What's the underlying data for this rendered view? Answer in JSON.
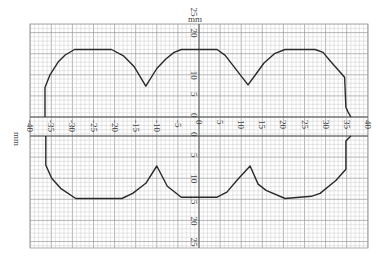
{
  "chart_data": {
    "type": "line",
    "title": "",
    "xlabel": "mm",
    "ylabel": "mm",
    "xlim": [
      -40,
      40
    ],
    "ylim_upper": [
      0,
      25
    ],
    "ylim_lower": [
      0,
      25
    ],
    "grid": true,
    "x_ticks": [
      -40,
      -35,
      -30,
      -25,
      -20,
      -15,
      -10,
      -5,
      0,
      5,
      10,
      15,
      20,
      25,
      30,
      35,
      40
    ],
    "y_ticks_upper": [
      0,
      5,
      10,
      20,
      25
    ],
    "y_ticks_lower": [
      0,
      5,
      10,
      15,
      20,
      25
    ],
    "series": [
      {
        "name": "upper profile",
        "x": [
          -36.5,
          -36.5,
          -35.3,
          -33.4,
          -31.7,
          -29.5,
          -20.7,
          -17.8,
          -15.4,
          -12.6,
          -10,
          -7.8,
          -5.9,
          -4.2,
          4.3,
          6.2,
          11.6,
          13.5,
          15.4,
          18,
          20.4,
          27.5,
          29.4,
          31,
          34.5,
          34.8,
          35.3,
          36
        ],
        "y": [
          0,
          7,
          10,
          13,
          14.7,
          16,
          16,
          14.4,
          12,
          7.3,
          11.5,
          13.8,
          15.3,
          16,
          16,
          14.6,
          7.6,
          10.2,
          12.8,
          15.1,
          16,
          16,
          15.3,
          13.4,
          9.4,
          2.3,
          1.2,
          0
        ]
      },
      {
        "name": "lower profile",
        "x": [
          36,
          34.8,
          34.8,
          32.5,
          28.7,
          26.6,
          20.4,
          15.9,
          14,
          12.1,
          9,
          6.6,
          4.3,
          -4.2,
          -7.5,
          -10,
          -12.6,
          -15.7,
          -18.3,
          -29.2,
          -32.8,
          -34.9,
          -36.3,
          -36.3
        ],
        "y": [
          0,
          1.2,
          7.9,
          10.5,
          13.6,
          14.3,
          14.8,
          12.9,
          11.4,
          7.1,
          10.5,
          13.3,
          14.5,
          14.5,
          11.9,
          7.1,
          11.2,
          13.6,
          14.8,
          14.8,
          12.4,
          10,
          6.9,
          0
        ]
      }
    ]
  },
  "labels": {
    "x_unit": "mm",
    "y_unit": "mm",
    "x_ticks": [
      "-40",
      "-35",
      "-30",
      "-25",
      "-20",
      "-15",
      "-10",
      "-5",
      "0",
      "5",
      "10",
      "15",
      "20",
      "25",
      "30",
      "35",
      "40"
    ],
    "y_ticks_upper": [
      "0",
      "5",
      "10",
      "20",
      "25"
    ],
    "y_ticks_lower": [
      "0",
      "5",
      "10",
      "15",
      "20",
      "25"
    ]
  },
  "colors": {
    "grid_minor": "#c8c8c8",
    "grid_major": "#9a9a9a",
    "axis": "#555555",
    "curve": "#2a2a2a",
    "text": "#444444"
  }
}
